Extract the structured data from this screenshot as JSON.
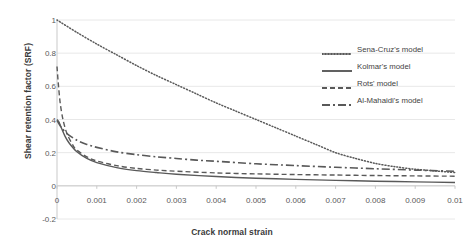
{
  "chart_data": {
    "type": "line",
    "title": "",
    "xlabel": "Crack normal strain",
    "ylabel": "Shear retention factor (SRF)",
    "xlim": [
      0,
      0.01
    ],
    "ylim": [
      -0.2,
      1
    ],
    "xticks": [
      "0",
      "0.001",
      "0.002",
      "0.003",
      "0.004",
      "0.005",
      "0.006",
      "0.007",
      "0.008",
      "0.009",
      "0.01"
    ],
    "xtick_values": [
      0,
      0.001,
      0.002,
      0.003,
      0.004,
      0.005,
      0.006,
      0.007,
      0.008,
      0.009,
      0.01
    ],
    "yticks": [
      "-0.2",
      "0",
      "0.2",
      "0.4",
      "0.6",
      "0.8",
      "1"
    ],
    "ytick_values": [
      -0.2,
      0,
      0.2,
      0.4,
      0.6,
      0.8,
      1
    ],
    "grid": true,
    "legend_position": "upper right",
    "line_color": "#595959",
    "series": [
      {
        "name": "Sena-Cruz's model",
        "style": "dotted",
        "x": [
          0,
          0.0005,
          0.001,
          0.0015,
          0.002,
          0.0025,
          0.003,
          0.0035,
          0.004,
          0.0045,
          0.005,
          0.0055,
          0.006,
          0.0065,
          0.007,
          0.0075,
          0.008,
          0.0085,
          0.009,
          0.0095,
          0.01
        ],
        "values": [
          1.0,
          0.925,
          0.855,
          0.79,
          0.725,
          0.665,
          0.61,
          0.555,
          0.5,
          0.45,
          0.4,
          0.35,
          0.3,
          0.25,
          0.2,
          0.165,
          0.135,
          0.115,
          0.1,
          0.09,
          0.08
        ]
      },
      {
        "name": "Kolmar's model",
        "style": "solid",
        "x": [
          0,
          5e-05,
          0.0001,
          0.0002,
          0.0003,
          0.0005,
          0.00075,
          0.001,
          0.0015,
          0.002,
          0.0025,
          0.003,
          0.004,
          0.005,
          0.006,
          0.007,
          0.008,
          0.009,
          0.01
        ],
        "values": [
          0.4,
          0.385,
          0.355,
          0.3,
          0.26,
          0.205,
          0.165,
          0.14,
          0.11,
          0.092,
          0.08,
          0.07,
          0.056,
          0.046,
          0.039,
          0.033,
          0.028,
          0.024,
          0.02
        ]
      },
      {
        "name": "Rots' model",
        "style": "dashed",
        "x": [
          0,
          3e-05,
          8e-05,
          0.00015,
          0.00025,
          0.0004,
          0.0005,
          0.00075,
          0.001,
          0.0015,
          0.002,
          0.0025,
          0.003,
          0.004,
          0.005,
          0.006,
          0.007,
          0.008,
          0.009,
          0.01
        ],
        "values": [
          0.72,
          0.625,
          0.5,
          0.4,
          0.315,
          0.245,
          0.215,
          0.175,
          0.15,
          0.122,
          0.105,
          0.095,
          0.088,
          0.078,
          0.072,
          0.068,
          0.065,
          0.062,
          0.06,
          0.058
        ]
      },
      {
        "name": "Al-Mahaidi's model",
        "style": "dashdot",
        "x": [
          0,
          0.0001,
          0.00025,
          0.0005,
          0.00075,
          0.001,
          0.0015,
          0.002,
          0.0025,
          0.003,
          0.0035,
          0.004,
          0.005,
          0.006,
          0.007,
          0.008,
          0.009,
          0.01
        ],
        "values": [
          0.395,
          0.355,
          0.315,
          0.275,
          0.25,
          0.232,
          0.205,
          0.188,
          0.175,
          0.165,
          0.155,
          0.148,
          0.133,
          0.122,
          0.112,
          0.103,
          0.095,
          0.088
        ]
      }
    ]
  }
}
